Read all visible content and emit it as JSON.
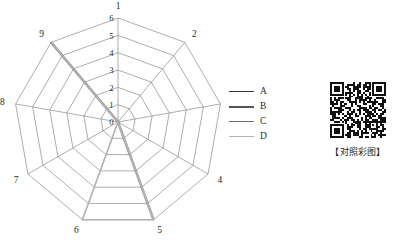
{
  "chart_data": {
    "type": "radar",
    "title": "",
    "categories": [
      "1",
      "2",
      "3",
      "4",
      "5",
      "6",
      "7",
      "8",
      "9"
    ],
    "radial_ticks": [
      "0",
      "1",
      "2",
      "3",
      "4",
      "5",
      "6"
    ],
    "rmin": 0,
    "rmax": 6,
    "grid": true,
    "rings": 6,
    "spokes": 9,
    "start_angle_deg": -90,
    "series": [
      {
        "name": "A",
        "color": "#3a3a3a",
        "values": [
          0,
          0,
          0,
          0,
          0,
          0,
          0,
          0,
          6
        ]
      },
      {
        "name": "B",
        "color": "#555555",
        "values": [
          0,
          0,
          0,
          0,
          6,
          0,
          0,
          0,
          6
        ]
      },
      {
        "name": "C",
        "color": "#6d6d6d",
        "values": [
          0,
          0,
          0,
          0,
          0,
          0,
          0,
          0,
          6
        ]
      },
      {
        "name": "D",
        "color": "#b4b4b4",
        "values": [
          0,
          0,
          0,
          0,
          6,
          6,
          0,
          0,
          6
        ]
      }
    ],
    "legend_position": "right",
    "xlabel": "",
    "ylabel": ""
  },
  "legend": {
    "entries": [
      {
        "label": "A",
        "color": "#3a3a3a",
        "weight": 1.4
      },
      {
        "label": "B",
        "color": "#555555",
        "weight": 2.6
      },
      {
        "label": "C",
        "color": "#6d6d6d",
        "weight": 1.0
      },
      {
        "label": "D",
        "color": "#b4b4b4",
        "weight": 1.6
      }
    ]
  },
  "qr": {
    "icon": "qr-code-icon",
    "caption": "【对照彩图】"
  }
}
